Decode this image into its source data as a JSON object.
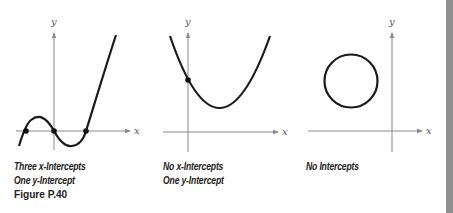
{
  "figure": {
    "label": "Figure P.40",
    "axis_labels": {
      "x": "x",
      "y": "y"
    },
    "graphs": [
      {
        "id": "cubic",
        "type": "cubic curve",
        "caption_lines": [
          "Three x-Intercepts",
          "One y-Intercept"
        ],
        "x_intercepts": 3,
        "y_intercepts": 1
      },
      {
        "id": "parabola",
        "type": "upward parabola",
        "caption_lines": [
          "No x-Intercepts",
          "One y-Intercept"
        ],
        "x_intercepts": 0,
        "y_intercepts": 1
      },
      {
        "id": "circle",
        "type": "circle",
        "caption_lines": [
          "No Intercepts"
        ],
        "x_intercepts": 0,
        "y_intercepts": 0
      }
    ]
  },
  "colors": {
    "curve": "#1a1a1a",
    "axis": "#8a8a8a",
    "sidebar": "#8f8f8f"
  }
}
